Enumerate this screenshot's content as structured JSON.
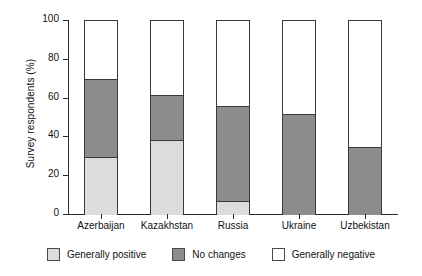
{
  "chart_data": {
    "type": "bar",
    "subtype": "stacked-bar-100",
    "title": "",
    "xlabel": "",
    "ylabel": "Survey respondents (%)",
    "ylim": [
      0,
      100
    ],
    "ytick_labels": [
      "0",
      "20",
      "40",
      "60",
      "80",
      "100"
    ],
    "yticks": [
      0,
      20,
      40,
      60,
      80,
      100
    ],
    "grid": false,
    "legend_position": "bottom",
    "categories": [
      "Azerbaijan",
      "Kazakhstan",
      "Russia",
      "Ukraine",
      "Uzbekistan"
    ],
    "series": [
      {
        "name": "Generally positive",
        "color": "#dcdcdc",
        "values": [
          30,
          38.5,
          7,
          0,
          0
        ]
      },
      {
        "name": "No changes",
        "color": "#8c8c8c",
        "values": [
          40,
          23.5,
          49,
          52,
          35
        ]
      },
      {
        "name": "Generally negative",
        "color": "#ffffff",
        "values": [
          30,
          38,
          44,
          48,
          65
        ]
      }
    ],
    "segment_tops": {
      "Azerbaijan": {
        "positive": 30,
        "no_changes": 70,
        "negative": 100
      },
      "Kazakhstan": {
        "positive": 38.5,
        "no_changes": 62,
        "negative": 100
      },
      "Russia": {
        "positive": 7,
        "no_changes": 56,
        "negative": 100
      },
      "Ukraine": {
        "positive": 0,
        "no_changes": 52,
        "negative": 100
      },
      "Uzbekistan": {
        "positive": 0,
        "no_changes": 35,
        "negative": 100
      }
    }
  },
  "axis": {
    "y_label": "Survey respondents (%)",
    "y_ticks": [
      {
        "value": 100,
        "label": "100"
      },
      {
        "value": 80,
        "label": "80"
      },
      {
        "value": 60,
        "label": "60"
      },
      {
        "value": 40,
        "label": "40"
      },
      {
        "value": 20,
        "label": "20"
      },
      {
        "value": 0,
        "label": "0"
      }
    ]
  },
  "legend": {
    "items": [
      {
        "label": "Generally positive",
        "color": "#dcdcdc"
      },
      {
        "label": "No changes",
        "color": "#8c8c8c"
      },
      {
        "label": "Generally negative",
        "color": "#ffffff"
      }
    ]
  }
}
